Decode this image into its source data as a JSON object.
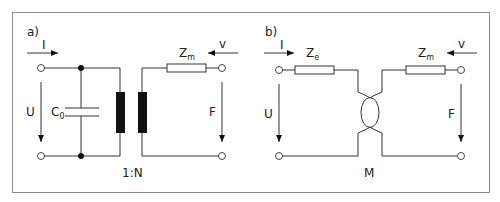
{
  "figure": {
    "frame_color": "#888888",
    "panels": [
      {
        "id": "a",
        "label": "a)",
        "input_current": "I",
        "input_voltage": "U",
        "capacitor": {
          "symbol": "C",
          "subscript": "0"
        },
        "transformer_ratio": "1:N",
        "mechanical_impedance": {
          "symbol": "Z",
          "subscript": "m"
        },
        "velocity": "v",
        "force": "F"
      },
      {
        "id": "b",
        "label": "b)",
        "input_current": "I",
        "input_voltage": "U",
        "electrical_impedance": {
          "symbol": "Z",
          "subscript": "e"
        },
        "gyrator": "M",
        "mechanical_impedance": {
          "symbol": "Z",
          "subscript": "m"
        },
        "velocity": "v",
        "force": "F"
      }
    ]
  }
}
